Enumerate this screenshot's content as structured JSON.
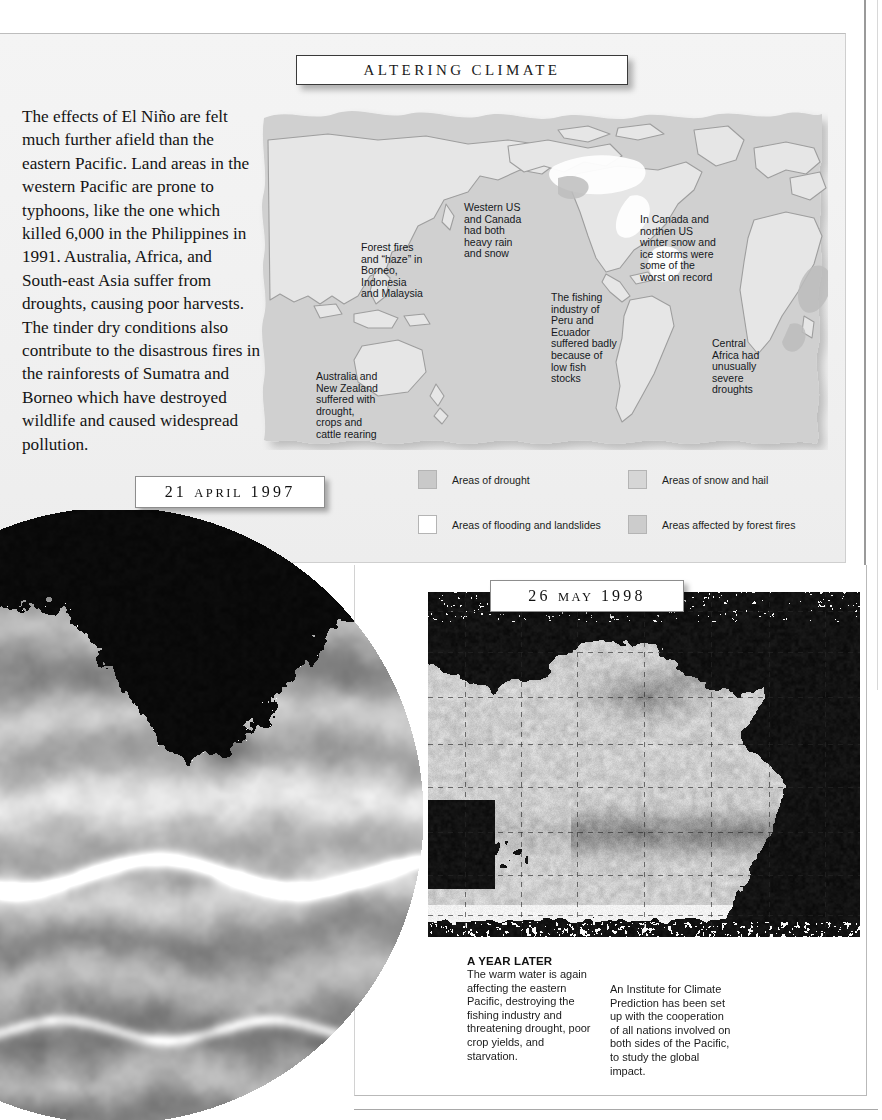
{
  "header": {
    "title": "ALTERING CLIMATE"
  },
  "article": {
    "body": "The effects of El Niño are felt much further afield than the eastern Pacific. Land areas in the western Pacific are prone to typhoons, like the one which killed 6,000 in the Philippines in 1991. Australia, Africa, and South-east Asia suffer from droughts, causing poor harvests. The tinder dry conditions also contribute to the disastrous fires in the rainforests of Sumatra and Borneo which have destroyed wildlife and caused widespread pollution."
  },
  "map": {
    "labels": [
      {
        "id": "borneo",
        "text": "Forest fires\nand “haze” in\nBorneo,\nIndonesia\nand Malaysia"
      },
      {
        "id": "westus",
        "text": "Western US\nand Canada\nhad both\nheavy rain\nand snow"
      },
      {
        "id": "canada",
        "text": "In Canada and\nnorthen US\nwinter snow and\nice storms were\nsome of the\nworst on record"
      },
      {
        "id": "peru",
        "text": "The fishing\nindustry of\nPeru and\nEcuador\nsuffered badly\nbecause of\nlow fish\nstocks"
      },
      {
        "id": "africa",
        "text": "Central\nAfrica had\nunusually\nsevere\ndroughts"
      },
      {
        "id": "australia",
        "text": "Australia and\nNew Zealand\nsuffered with\ndrought,\ncrops and\ncattle rearing"
      }
    ],
    "legend": [
      {
        "label": "Areas of drought",
        "color": "#c9c9c9"
      },
      {
        "label": "Areas of flooding and landslides",
        "color": "#ffffff"
      },
      {
        "label": "Areas of snow and hail",
        "color": "#d6d6d6"
      },
      {
        "label": "Areas affected by forest fires",
        "color": "#cccccc"
      }
    ],
    "colors": {
      "ocean": "#cfcfcf",
      "land": "#e3e3e3",
      "outline": "#9b9b9b",
      "highlight": "#ffffff"
    }
  },
  "dates": {
    "first": {
      "day": "21",
      "month": "APRIL",
      "year": "1997"
    },
    "second": {
      "day": "26",
      "month": "MAY",
      "year": "1998"
    }
  },
  "caption": {
    "heading": "A YEAR LATER",
    "column_1": "The warm water is again affecting the eastern Pacific, destroying the fishing industry and threatening drought, poor crop yields, and starvation.",
    "column_2": "An Institute for Climate Prediction has been set up with the cooperation of all nations involved on both sides of the Pacific, to study the global impact."
  },
  "imagery": {
    "globe_alt": "satellite sea-surface-temperature globe, 21 April 1997",
    "satellite_alt": "Pacific sea-surface-temperature map, 26 May 1998"
  }
}
